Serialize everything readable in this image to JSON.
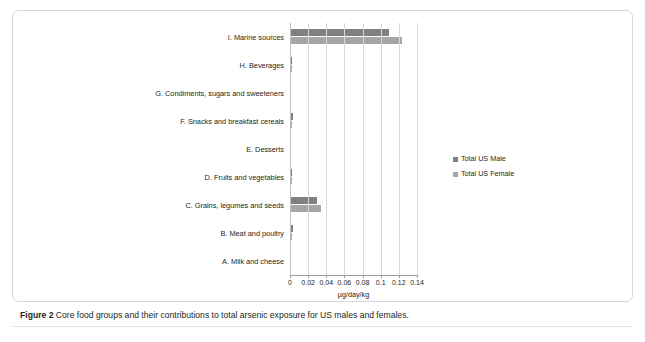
{
  "figure": {
    "caption_label": "Figure 2",
    "caption_text": " Core food groups and their contributions to total arsenic exposure for US males and females."
  },
  "legend": {
    "position": "right",
    "items": [
      {
        "label": "Total US Male",
        "color": "#808080"
      },
      {
        "label": "Total US Female",
        "color": "#a6a6a6"
      }
    ]
  },
  "axis": {
    "title": "µg/day/kg",
    "ticks": [
      "0",
      "0.02",
      "0.04",
      "0.06",
      "0.08",
      "0.1",
      "0.12",
      "0.14"
    ]
  },
  "chart_data": {
    "type": "bar",
    "orientation": "horizontal",
    "title": "",
    "xlabel": "µg/day/kg",
    "ylabel": "",
    "xlim": [
      0,
      0.14
    ],
    "grid": true,
    "legend_position": "right",
    "categories": [
      "I. Marine sources",
      "H. Beverages",
      "G. Condiments, sugars and sweeteners",
      "F. Snacks and breakfast cereals",
      "E. Desserts",
      "D. Fruits and vegetables",
      "C. Grains, legumes and seeds",
      "B. Meat and poultry",
      "A. Milk and cheese"
    ],
    "series": [
      {
        "name": "Total US Male",
        "color": "#808080",
        "values": [
          0.109,
          0.002,
          0.0,
          0.003,
          0.001,
          0.002,
          0.03,
          0.003,
          0.0
        ]
      },
      {
        "name": "Total US Female",
        "color": "#a6a6a6",
        "values": [
          0.123,
          0.002,
          0.0,
          0.002,
          0.001,
          0.002,
          0.034,
          0.002,
          0.0
        ]
      }
    ]
  }
}
